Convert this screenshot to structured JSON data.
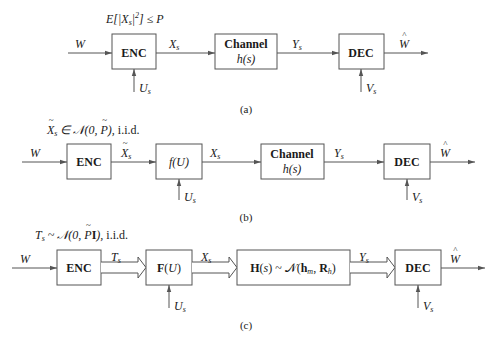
{
  "diagram_a": {
    "caption": "(a)",
    "constraint": "E[|X_s|^2] ≤ P",
    "input": "W",
    "output": "Ŵ",
    "blocks": [
      {
        "id": "enc",
        "label": "ENC"
      },
      {
        "id": "channel",
        "label": "Channel",
        "sublabel": "h(s)"
      },
      {
        "id": "dec",
        "label": "DEC"
      }
    ],
    "signals": {
      "enc_out": "X_s",
      "channel_out": "Y_s",
      "enc_side": "U_s",
      "dec_side": "V_s"
    }
  },
  "diagram_b": {
    "caption": "(b)",
    "constraint": "X̃_s ∈ 𝒩(0, P̃), i.i.d.",
    "input": "W",
    "output": "Ŵ",
    "blocks": [
      {
        "id": "enc",
        "label": "ENC"
      },
      {
        "id": "mapper",
        "label": "f(U)"
      },
      {
        "id": "channel",
        "label": "Channel",
        "sublabel": "h(s)"
      },
      {
        "id": "dec",
        "label": "DEC"
      }
    ],
    "signals": {
      "enc_out": "X̃_s",
      "mapper_out": "X_s",
      "channel_out": "Y_s",
      "mapper_side": "U_s",
      "dec_side": "V_s"
    }
  },
  "diagram_c": {
    "caption": "(c)",
    "constraint": "T_s ~ 𝒩(0, P̃I), i.i.d.",
    "input": "W",
    "output": "Ŵ",
    "blocks": [
      {
        "id": "enc",
        "label": "ENC"
      },
      {
        "id": "mapper",
        "label": "F(U)"
      },
      {
        "id": "channel",
        "label": "H(s) ~ 𝒩(h_m, R_h)"
      },
      {
        "id": "dec",
        "label": "DEC"
      }
    ],
    "signals": {
      "enc_out": "T_s",
      "mapper_out": "X_s",
      "channel_out": "Y_s",
      "mapper_side": "U_s",
      "dec_side": "V_s"
    }
  }
}
